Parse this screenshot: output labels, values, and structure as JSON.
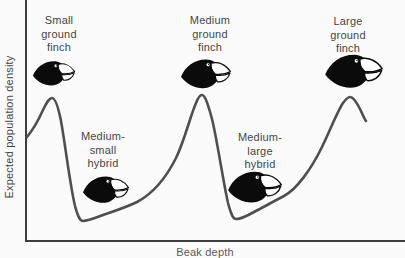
{
  "figure_type": "conceptual-diagram",
  "axes": {
    "y_label": "Expected population density",
    "x_label": "Beak depth"
  },
  "labels": {
    "small_finch": {
      "line1": "Small",
      "line2": "ground",
      "line3": "finch"
    },
    "medium_finch": {
      "line1": "Medium",
      "line2": "ground",
      "line3": "finch"
    },
    "large_finch": {
      "line1": "Large",
      "line2": "ground",
      "line3": "finch"
    },
    "ms_hybrid": {
      "line1": "Medium-",
      "line2": "small",
      "line3": "hybrid"
    },
    "ml_hybrid": {
      "line1": "Medium-",
      "line2": "large",
      "line3": "hybrid"
    }
  },
  "icons": {
    "finch_head": "finch-head-icon"
  },
  "colors": {
    "background": "#fbfbfb",
    "axis": "#3e3e3e",
    "curve": "#4f4f4f",
    "text": "#464646",
    "finch_silhouette": "#0b0b0b",
    "beak_fill": "#ffffff"
  },
  "curve": {
    "description": "three peaks at pure species, two valleys at hybrids",
    "path": "M 27 137 C 32 131 38 121 43 110 C 47 102 49 98 52 98 C 55 98 58 106 61 121 C 65 143 70 185 75 206 C 78 217 80 221 83 221 C 88 221 95 218 103 215 C 115 211 127 207 137 202 C 152 194 166 178 176 158 C 184 142 191 114 196 103 C 198 98 200 95 202 95 C 205 95 208 104 212 119 C 217 139 223 181 228 203 C 231 214 233 219 236 219 C 241 219 247 216 254 212 C 264 207 274 201 284 196 C 297 189 311 169 321 149 C 329 133 337 112 343 103 C 346 99 348 97 350 97 C 353 97 357 103 360 109 C 362 113 364 118 366 121"
  }
}
